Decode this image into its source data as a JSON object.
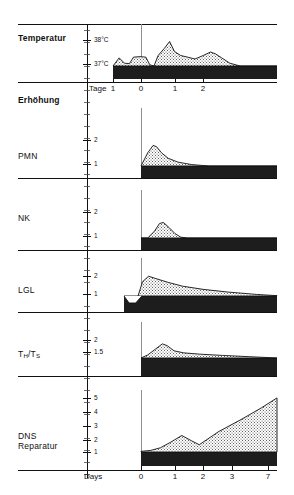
{
  "figure": {
    "section_header": "Erhöhung",
    "rows": [
      {
        "id": "temperatur",
        "label": "Temperatur",
        "bold": true,
        "y_ticks": [
          "38°C",
          "37°C"
        ],
        "x_axis_name": "Tage",
        "x_ticks": [
          "1",
          "0",
          "1",
          "2"
        ]
      },
      {
        "id": "pmn",
        "label": "PMN",
        "bold": false,
        "y_ticks": [
          "2",
          "1"
        ]
      },
      {
        "id": "nk",
        "label": "NK",
        "bold": false,
        "y_ticks": [
          "2",
          "1"
        ]
      },
      {
        "id": "lgl",
        "label": "LGL",
        "bold": false,
        "y_ticks": [
          "2",
          "1"
        ]
      },
      {
        "id": "th-ts",
        "label": "TH/TS",
        "label_html": "T<sub>H</sub>/T<sub>S</sub>",
        "bold": false,
        "y_ticks": [
          "2",
          "1.5"
        ]
      },
      {
        "id": "dns-reparatur",
        "label": "DNS\nReparatur",
        "bold": false,
        "y_ticks": [
          "5",
          "4",
          "3",
          "2",
          "1"
        ],
        "x_axis_name": "Days",
        "x_ticks": [
          "0",
          "1",
          "2",
          "3",
          "7"
        ]
      }
    ],
    "colors": {
      "ink": "#111111",
      "band_fill": "#1d1d1d",
      "stipple_fill": "#cfcfcf",
      "background": "#ffffff"
    }
  },
  "chart_data": {
    "type": "area",
    "title": "",
    "subtitle": "",
    "xlabel": "Days",
    "ylabel": "Erhöhung",
    "grid": false,
    "legend": "none",
    "panels": [
      {
        "name": "Temperatur",
        "ylabel": "Temperatur",
        "xlabel": "Tage",
        "x_ticks": [
          -1,
          0,
          1,
          2
        ],
        "x_tick_labels": [
          "1",
          "0",
          "1",
          "2"
        ],
        "y_ticks": [
          37,
          38
        ],
        "y_tick_labels": [
          "37°C",
          "38°C"
        ],
        "ylim": [
          36.6,
          38.4
        ],
        "baseline": 37,
        "x": [
          -1.0,
          -0.85,
          -0.72,
          -0.6,
          -0.5,
          -0.34,
          -0.2,
          -0.1,
          0.0,
          0.1,
          0.25,
          0.38,
          0.5,
          0.65,
          0.82,
          1.0,
          1.2,
          1.38,
          1.5,
          1.65,
          1.85,
          2.1,
          2.4,
          3.0
        ],
        "y": [
          37.0,
          37.35,
          37.12,
          37.1,
          37.38,
          37.4,
          37.38,
          37.05,
          37.0,
          37.45,
          37.75,
          38.05,
          37.62,
          37.45,
          37.38,
          37.3,
          37.45,
          37.6,
          37.52,
          37.35,
          37.12,
          37.0,
          37.0,
          37.0
        ]
      },
      {
        "name": "PMN",
        "ylabel": "PMN",
        "y_ticks": [
          1,
          2
        ],
        "y_tick_labels": [
          "1",
          "2"
        ],
        "ylim": [
          0.8,
          3.2
        ],
        "baseline": 1,
        "x": [
          0.0,
          0.35,
          0.62,
          0.8,
          1.05,
          1.4,
          1.9,
          2.6,
          3.5,
          7.0
        ],
        "y": [
          1.0,
          1.55,
          1.85,
          1.8,
          1.55,
          1.32,
          1.16,
          1.06,
          1.0,
          1.0
        ]
      },
      {
        "name": "NK",
        "ylabel": "NK",
        "y_ticks": [
          1,
          2
        ],
        "y_tick_labels": [
          "1",
          "2"
        ],
        "ylim": [
          0.8,
          3.2
        ],
        "baseline": 1,
        "x": [
          0.0,
          0.35,
          0.7,
          0.95,
          1.15,
          1.45,
          1.75,
          2.05,
          2.4,
          3.0,
          7.0
        ],
        "y": [
          1.0,
          1.0,
          1.35,
          1.72,
          1.78,
          1.52,
          1.22,
          1.04,
          1.0,
          1.0,
          1.0
        ]
      },
      {
        "name": "LGL",
        "ylabel": "LGL",
        "y_ticks": [
          1,
          2
        ],
        "y_tick_labels": [
          "1",
          "2"
        ],
        "ylim": [
          0.8,
          3.2
        ],
        "baseline": 1,
        "x": [
          -0.45,
          -0.2,
          0.0,
          0.2,
          0.45,
          0.75,
          1.1,
          1.7,
          2.4,
          3.4,
          4.6,
          6.0,
          7.0
        ],
        "y": [
          1.0,
          0.72,
          0.66,
          0.86,
          1.9,
          2.25,
          2.1,
          1.86,
          1.62,
          1.42,
          1.25,
          1.1,
          1.02
        ]
      },
      {
        "name": "TH/TS",
        "ylabel": "T_H/T_S",
        "y_ticks": [
          1.5,
          2
        ],
        "y_tick_labels": [
          "1.5",
          "2"
        ],
        "ylim": [
          1.2,
          2.6
        ],
        "baseline": 1.5,
        "x": [
          0.0,
          0.35,
          0.75,
          1.1,
          1.35,
          1.7,
          2.2,
          3.0,
          4.2,
          5.6,
          7.0
        ],
        "y": [
          1.5,
          1.62,
          1.85,
          2.05,
          1.98,
          1.78,
          1.7,
          1.65,
          1.6,
          1.55,
          1.5
        ]
      },
      {
        "name": "DNS Reparatur",
        "ylabel": "DNS Reparatur",
        "xlabel": "Days",
        "x_ticks": [
          0,
          1,
          2,
          3,
          7
        ],
        "x_tick_labels": [
          "0",
          "1",
          "2",
          "3",
          "7"
        ],
        "y_ticks": [
          1,
          2,
          3,
          4,
          5
        ],
        "y_tick_labels": [
          "1",
          "2",
          "3",
          "4",
          "5"
        ],
        "ylim": [
          0.7,
          5.4
        ],
        "baseline": 1,
        "x": [
          0.0,
          0.5,
          1.0,
          1.5,
          2.1,
          2.6,
          3.0,
          4.0,
          5.2,
          6.2,
          7.0
        ],
        "y": [
          1.05,
          1.12,
          1.32,
          1.72,
          2.25,
          1.85,
          1.55,
          2.55,
          3.5,
          4.35,
          5.1
        ]
      }
    ]
  }
}
